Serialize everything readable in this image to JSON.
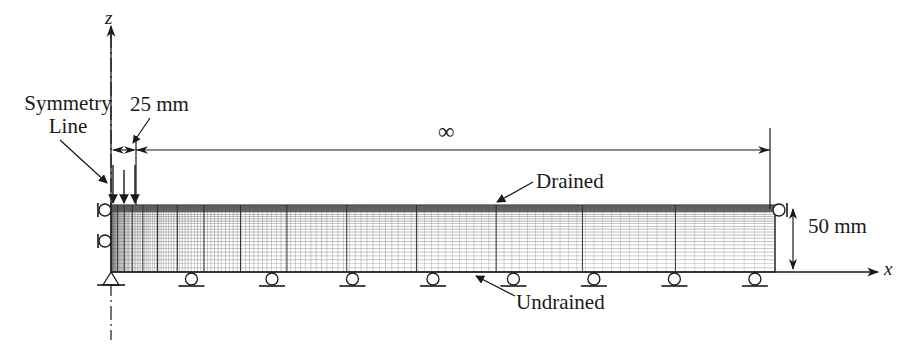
{
  "figure": {
    "axes": {
      "vertical_label": "z",
      "horizontal_label": "x"
    },
    "annotations": {
      "symmetry_line": "Symmetry\nLine",
      "symmetry_line_1": "Symmetry",
      "symmetry_line_2": "Line",
      "width_dimension": "25 mm",
      "infinite_extent": "∞",
      "top_boundary": "Drained",
      "bottom_boundary": "Undrained",
      "depth_dimension": "50 mm"
    },
    "colors": {
      "line": "#1a1a1a",
      "mesh": "#555555",
      "background": "#ffffff"
    },
    "geometry": {
      "mesh_left_x": 111,
      "mesh_right_x": 775,
      "mesh_top_y": 205,
      "mesh_bottom_y": 272,
      "loaded_width_right_x": 136,
      "dimension_line_y": 150,
      "vertical_dim_x": 793,
      "axis_x_y": 272,
      "axis_z_x": 111
    },
    "supports": {
      "pin_count": 1,
      "bottom_roller_count": 8,
      "left_roller_count": 2,
      "right_roller_count": 1,
      "load_arrow_count": 3
    }
  }
}
